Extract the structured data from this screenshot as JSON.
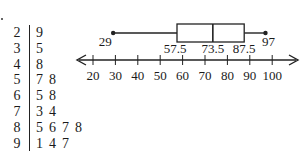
{
  "chart_data": [
    {
      "type": "table",
      "title": "Stem-and-leaf plot",
      "stems": [
        2,
        3,
        4,
        5,
        6,
        7,
        8,
        9
      ],
      "leaves": [
        [
          9
        ],
        [
          5
        ],
        [
          8
        ],
        [
          7,
          8
        ],
        [
          5,
          8
        ],
        [
          3,
          4
        ],
        [
          5,
          6,
          7,
          8
        ],
        [
          1,
          4,
          7
        ]
      ],
      "values": [
        29,
        35,
        48,
        57,
        58,
        65,
        68,
        73,
        74,
        85,
        86,
        87,
        88,
        91,
        94,
        97
      ]
    },
    {
      "type": "boxplot",
      "title": "Box-and-whisker plot",
      "min": 29,
      "q1": 57.5,
      "median": 73.5,
      "q3": 87.5,
      "max": 97,
      "labels": [
        "29",
        "57.5",
        "73.5",
        "87.5",
        "97"
      ],
      "axis": {
        "ticks": [
          20,
          30,
          40,
          50,
          60,
          70,
          80,
          90,
          100
        ],
        "tick_labels": [
          "20",
          "30",
          "40",
          "50",
          "60",
          "70",
          "80",
          "90",
          "100"
        ],
        "range": [
          15,
          105
        ],
        "arrows": "both"
      }
    }
  ],
  "stemleaf": {
    "rows": [
      {
        "stem": "2",
        "leaves": [
          "9"
        ]
      },
      {
        "stem": "3",
        "leaves": [
          "5"
        ]
      },
      {
        "stem": "4",
        "leaves": [
          "8"
        ]
      },
      {
        "stem": "5",
        "leaves": [
          "7",
          "8"
        ]
      },
      {
        "stem": "6",
        "leaves": [
          "5",
          "8"
        ]
      },
      {
        "stem": "7",
        "leaves": [
          "3",
          "4"
        ]
      },
      {
        "stem": "8",
        "leaves": [
          "5",
          "6",
          "7",
          "8"
        ]
      },
      {
        "stem": "9",
        "leaves": [
          "1",
          "4",
          "7"
        ]
      }
    ]
  },
  "boxplot": {
    "min_label": "29",
    "q1_label": "57.5",
    "median_label": "73.5",
    "q3_label": "87.5",
    "max_label": "97",
    "ticks": [
      "20",
      "30",
      "40",
      "50",
      "60",
      "70",
      "80",
      "90",
      "100"
    ]
  }
}
